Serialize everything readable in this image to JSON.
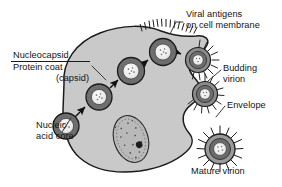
{
  "figure": {
    "kind": "biology-diagram",
    "background_color": "#ffffff",
    "cell_fill": "#c9c9c9",
    "cell_stroke": "#1b1b1b",
    "nucleus_fill": "#b5b5b5",
    "capsid_ring_color": "#6e6e6e",
    "core_fill": "#f2f2f2",
    "arrow_color": "#111111",
    "leader_color": "#3a3a3a",
    "text_color": "#131313"
  },
  "labels": {
    "nucleocapsid": "Nucleocapsid",
    "protein_coat": "Protein coat",
    "capsid": "(capsid)",
    "nucleic": "Nucleic",
    "acid_core": "acid core",
    "viral_antigens": "Viral antigens",
    "on_cell_membrane": "on cell membrane",
    "budding": "Budding",
    "virion": "virion",
    "envelope": "Envelope",
    "mature_virion": "Mature virion"
  },
  "structures": {
    "nucleocapsids": [
      {
        "name": "nucleocapsid-1",
        "cx": 96,
        "cy": 96,
        "r": 13
      },
      {
        "name": "nucleocapsid-2",
        "cx": 128,
        "cy": 73,
        "r": 13
      },
      {
        "name": "nucleocapsid-3",
        "cx": 158,
        "cy": 52,
        "r": 13
      },
      {
        "name": "nucleocapsid-4",
        "cx": 194,
        "cy": 62,
        "r": 13
      }
    ],
    "budding_virions": [
      {
        "name": "budding-virion-1",
        "cx": 196,
        "cy": 62,
        "r": 12,
        "spikes": true
      },
      {
        "name": "budding-virion-2",
        "cx": 205,
        "cy": 93,
        "r": 12,
        "spikes": true
      }
    ],
    "mature_virion": {
      "name": "mature-virion",
      "cx": 220,
      "cy": 150,
      "r": 15,
      "spikes": true
    },
    "nucleus": {
      "cx": 131,
      "cy": 139,
      "rx": 17,
      "ry": 24,
      "rotate": -18
    },
    "nucleolus": {
      "cx": 137,
      "cy": 146,
      "r": 3.3
    },
    "membrane_antigens": {
      "from_x": 148,
      "to_x": 200,
      "count": 14
    }
  },
  "arrows": [
    {
      "name": "arrow-1",
      "x1": 75,
      "y1": 117,
      "x2": 86,
      "y2": 106
    },
    {
      "name": "arrow-2",
      "x1": 110,
      "y1": 88,
      "x2": 119,
      "y2": 80
    },
    {
      "name": "arrow-3",
      "x1": 141,
      "y1": 66,
      "x2": 149,
      "y2": 59
    },
    {
      "name": "arrow-4",
      "x1": 171,
      "y1": 51,
      "x2": 182,
      "y2": 55
    }
  ]
}
